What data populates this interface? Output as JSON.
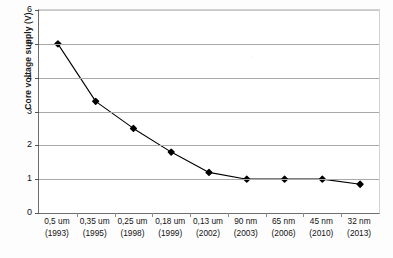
{
  "chart_data": {
    "type": "line",
    "title": "",
    "xlabel": "",
    "ylabel": "Core voltage supply (V)",
    "ylim": [
      0,
      6
    ],
    "yticks": [
      0,
      1,
      2,
      3,
      4,
      5,
      6
    ],
    "ytick_labels": [
      "0",
      "1",
      "2",
      "3",
      "4",
      "5",
      "6"
    ],
    "grid": "horizontal",
    "legend": "none",
    "marker": "filled-diamond",
    "line_color": "#000000",
    "marker_color": "#000000",
    "grid_color": "#a9a9a9",
    "categories": [
      "0,5 um\n(1993)",
      "0,35 um\n(1995)",
      "0,25 um\n(1998)",
      "0,18 um\n(1999)",
      "0,13 um\n(2002)",
      "90 nm\n(2003)",
      "65 nm\n(2006)",
      "45 nm\n(2010)",
      "32 nm\n(2013)"
    ],
    "points": [
      {
        "node": "0,5 um",
        "year": "1993",
        "line1": "0,5 um",
        "line2": "(1993)",
        "value": 5.0
      },
      {
        "node": "0,35 um",
        "year": "1995",
        "line1": "0,35 um",
        "line2": "(1995)",
        "value": 3.3
      },
      {
        "node": "0,25 um",
        "year": "1998",
        "line1": "0,25 um",
        "line2": "(1998)",
        "value": 2.5
      },
      {
        "node": "0,18 um",
        "year": "1999",
        "line1": "0,18 um",
        "line2": "(1999)",
        "value": 1.8
      },
      {
        "node": "0,13 um",
        "year": "2002",
        "line1": "0,13 um",
        "line2": "(2002)",
        "value": 1.2
      },
      {
        "node": "90 nm",
        "year": "2003",
        "line1": "90 nm",
        "line2": "(2003)",
        "value": 1.0
      },
      {
        "node": "65 nm",
        "year": "2006",
        "line1": "65 nm",
        "line2": "(2006)",
        "value": 1.0
      },
      {
        "node": "45 nm",
        "year": "2010",
        "line1": "45 nm",
        "line2": "(2010)",
        "value": 1.0
      },
      {
        "node": "32 nm",
        "year": "2013",
        "line1": "32 nm",
        "line2": "(2013)",
        "value": 0.85
      }
    ],
    "values": [
      5.0,
      3.3,
      2.5,
      1.8,
      1.2,
      1.0,
      1.0,
      1.0,
      0.85
    ]
  }
}
